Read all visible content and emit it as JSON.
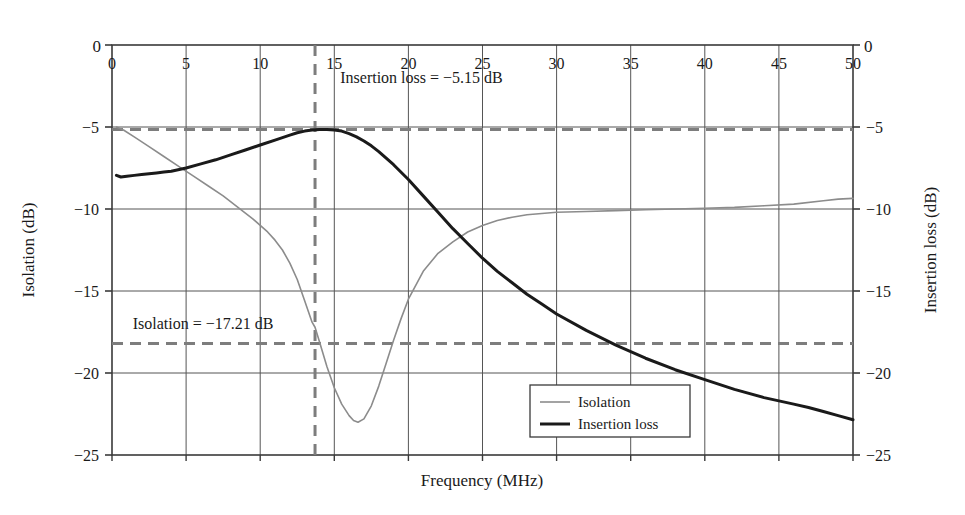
{
  "chart_data": {
    "type": "line",
    "title": "",
    "xlabel": "Frequency (MHz)",
    "ylabel_left": "Isolation (dB)",
    "ylabel_right": "Insertion loss (dB)",
    "xlim": [
      0,
      50
    ],
    "ylim_left": [
      -25,
      0
    ],
    "ylim_right": [
      -25,
      0
    ],
    "xticks": [
      "0",
      "5",
      "10",
      "15",
      "20",
      "25",
      "30",
      "35",
      "40",
      "45",
      "50"
    ],
    "xtick_values": [
      0,
      5,
      10,
      15,
      20,
      25,
      30,
      35,
      40,
      45,
      50
    ],
    "yticks_left": [
      "0",
      "−5",
      "−10",
      "−15",
      "−20",
      "−25"
    ],
    "ytick_values_left": [
      0,
      -5,
      -10,
      -15,
      -20,
      -25
    ],
    "yticks_right": [
      "0",
      "−5",
      "−10",
      "−15",
      "−20",
      "−25"
    ],
    "ytick_values_right": [
      0,
      -5,
      -10,
      -15,
      -20,
      -25
    ],
    "grid": true,
    "legend_position": "lower-right-inside",
    "series": [
      {
        "name": "Isolation",
        "axis": "left",
        "color": "#8c8c8c",
        "width": 1.6,
        "x": [
          0.3,
          0.8,
          1.5,
          2.5,
          3.5,
          4.5,
          5.5,
          6.5,
          7.5,
          8.5,
          9.5,
          10.5,
          11.0,
          11.5,
          12.0,
          12.5,
          13.0,
          13.5,
          13.7,
          14.0,
          14.5,
          15.0,
          15.5,
          16.0,
          16.3,
          16.6,
          17.0,
          17.5,
          18.0,
          18.5,
          19.0,
          19.5,
          20.0,
          21.0,
          22.0,
          23.0,
          24.0,
          25.0,
          26.0,
          27.0,
          28.0,
          30.0,
          32.0,
          34.0,
          36.0,
          38.0,
          40.0,
          42.0,
          44.0,
          46.0,
          48.0,
          49.0,
          50.0
        ],
        "y": [
          -5.0,
          -5.2,
          -5.6,
          -6.2,
          -6.8,
          -7.4,
          -8.0,
          -8.6,
          -9.2,
          -9.9,
          -10.6,
          -11.4,
          -11.9,
          -12.5,
          -13.3,
          -14.3,
          -15.6,
          -16.9,
          -17.21,
          -18.1,
          -19.6,
          -20.9,
          -21.9,
          -22.6,
          -22.9,
          -23.0,
          -22.8,
          -22.0,
          -20.8,
          -19.4,
          -18.0,
          -16.7,
          -15.5,
          -13.8,
          -12.7,
          -12.0,
          -11.4,
          -11.0,
          -10.7,
          -10.5,
          -10.35,
          -10.2,
          -10.15,
          -10.1,
          -10.05,
          -10.0,
          -9.95,
          -9.9,
          -9.8,
          -9.7,
          -9.5,
          -9.4,
          -9.35
        ]
      },
      {
        "name": "Insertion loss",
        "axis": "right",
        "color": "#1a1a1a",
        "width": 3.0,
        "x": [
          0.3,
          0.6,
          1.0,
          1.5,
          2.0,
          2.5,
          3.0,
          3.5,
          4.0,
          5.0,
          6.0,
          7.0,
          8.0,
          9.0,
          10.0,
          11.0,
          12.0,
          12.5,
          13.0,
          13.5,
          14.0,
          14.5,
          15.0,
          15.5,
          16.0,
          16.5,
          17.0,
          17.5,
          18.0,
          19.0,
          20.0,
          21.0,
          22.0,
          23.0,
          24.0,
          25.0,
          26.0,
          27.0,
          28.0,
          29.0,
          30.0,
          32.0,
          34.0,
          36.0,
          38.0,
          40.0,
          42.0,
          44.0,
          46.0,
          47.0,
          48.0,
          49.0,
          50.0
        ],
        "y": [
          -7.95,
          -8.05,
          -8.0,
          -7.95,
          -7.9,
          -7.85,
          -7.8,
          -7.75,
          -7.7,
          -7.5,
          -7.25,
          -7.0,
          -6.7,
          -6.4,
          -6.1,
          -5.8,
          -5.5,
          -5.35,
          -5.25,
          -5.18,
          -5.15,
          -5.15,
          -5.18,
          -5.25,
          -5.4,
          -5.6,
          -5.85,
          -6.15,
          -6.5,
          -7.3,
          -8.2,
          -9.2,
          -10.2,
          -11.2,
          -12.1,
          -13.0,
          -13.8,
          -14.5,
          -15.2,
          -15.8,
          -16.4,
          -17.4,
          -18.3,
          -19.1,
          -19.8,
          -20.4,
          -21.0,
          -21.5,
          -21.9,
          -22.1,
          -22.35,
          -22.6,
          -22.85
        ]
      }
    ],
    "annotations": [
      {
        "name": "insertion-loss-annotation",
        "text": "Insertion loss = −5.15 dB",
        "x": 15.4,
        "y": -2.3
      },
      {
        "name": "isolation-annotation",
        "text": "Isolation = −17.21 dB",
        "x": 1.4,
        "y": -17.3
      }
    ],
    "reference_lines": [
      {
        "name": "insertion-loss-level",
        "orientation": "horizontal",
        "value": -5.15,
        "style": "dashed",
        "color": "#7d7d7d"
      },
      {
        "name": "isolation-level",
        "orientation": "horizontal",
        "value": -18.2,
        "style": "dashed",
        "color": "#7d7d7d"
      },
      {
        "name": "center-frequency",
        "orientation": "vertical",
        "value": 13.7,
        "style": "dashed",
        "color": "#7d7d7d"
      }
    ],
    "corner_labels": {
      "top_left": "0",
      "top_right": "0"
    },
    "legend": [
      {
        "label": "Isolation",
        "color": "#8c8c8c",
        "width": 1.6
      },
      {
        "label": "Insertion loss",
        "color": "#1a1a1a",
        "width": 3.0
      }
    ]
  }
}
